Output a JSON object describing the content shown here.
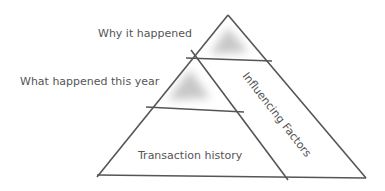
{
  "diagram": {
    "type": "pyramid",
    "labels": {
      "why": "Why it happened",
      "what": "What happened this year",
      "transaction": "Transaction history",
      "influencing": "Influencing Factors"
    },
    "colors": {
      "line": "#555555",
      "text": "#555555",
      "shade": "#c8c8c8",
      "background": "#ffffff"
    }
  }
}
